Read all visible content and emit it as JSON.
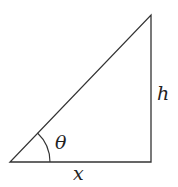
{
  "diagram": {
    "type": "right-triangle",
    "labels": {
      "angle": "θ",
      "height": "h",
      "base": "x"
    },
    "colors": {
      "stroke": "#333333",
      "text": "#222222",
      "background": "#ffffff"
    }
  }
}
